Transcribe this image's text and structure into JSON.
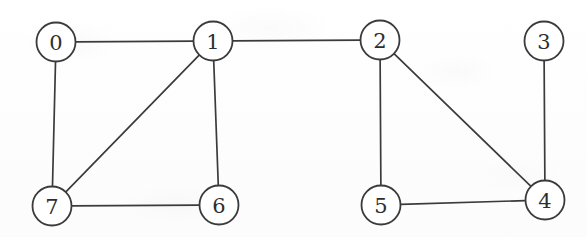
{
  "figure": {
    "width": 587,
    "height": 237,
    "background_color": "#fefefe",
    "stroke_color": "#3b3b3b",
    "label_color": "#2e2e2e",
    "node_fill": "#ffffff",
    "node_radius": 19.5
  },
  "chart_data": {
    "type": "diagram",
    "diagram_kind": "node-link-graph",
    "directed": false,
    "weighted": false,
    "node_count": 8,
    "edge_count": 10,
    "nodes": [
      {
        "id": "0",
        "label": "0",
        "x": 56,
        "y": 42,
        "degree": 2
      },
      {
        "id": "1",
        "label": "1",
        "x": 213,
        "y": 41,
        "degree": 4
      },
      {
        "id": "2",
        "label": "2",
        "x": 380,
        "y": 40,
        "degree": 3
      },
      {
        "id": "3",
        "label": "3",
        "x": 544,
        "y": 41,
        "degree": 1
      },
      {
        "id": "4",
        "label": "4",
        "x": 545,
        "y": 200,
        "degree": 3
      },
      {
        "id": "5",
        "label": "5",
        "x": 381,
        "y": 205,
        "degree": 2
      },
      {
        "id": "6",
        "label": "6",
        "x": 219,
        "y": 205,
        "degree": 2
      },
      {
        "id": "7",
        "label": "7",
        "x": 52,
        "y": 206,
        "degree": 3
      }
    ],
    "edges": [
      {
        "source": "0",
        "target": "1"
      },
      {
        "source": "0",
        "target": "7"
      },
      {
        "source": "1",
        "target": "2"
      },
      {
        "source": "1",
        "target": "6"
      },
      {
        "source": "1",
        "target": "7"
      },
      {
        "source": "2",
        "target": "4"
      },
      {
        "source": "2",
        "target": "5"
      },
      {
        "source": "3",
        "target": "4"
      },
      {
        "source": "4",
        "target": "5"
      },
      {
        "source": "6",
        "target": "7"
      }
    ],
    "adjacency": {
      "0": [
        "1",
        "7"
      ],
      "1": [
        "0",
        "2",
        "6",
        "7"
      ],
      "2": [
        "1",
        "4",
        "5"
      ],
      "3": [
        "4"
      ],
      "4": [
        "2",
        "3",
        "5"
      ],
      "5": [
        "2",
        "4"
      ],
      "6": [
        "1",
        "7"
      ],
      "7": [
        "0",
        "1",
        "6"
      ]
    }
  }
}
